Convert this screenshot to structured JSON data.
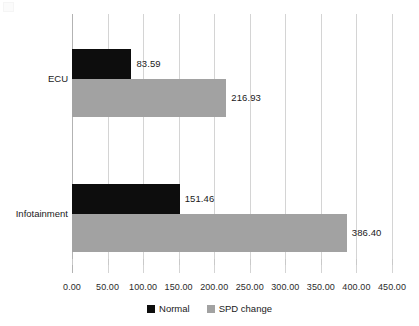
{
  "chart_data": {
    "type": "bar",
    "orientation": "horizontal",
    "title": "",
    "subtitle": "",
    "xlabel": "",
    "ylabel": "",
    "categories": [
      "ECU",
      "Infotainment"
    ],
    "series": [
      {
        "name": "Normal",
        "color": "#0d0d0d",
        "values": [
          83.59,
          151.46
        ],
        "value_labels": [
          "83.59",
          "151.46"
        ]
      },
      {
        "name": "SPD change",
        "color": "#a2a2a2",
        "values": [
          216.93,
          386.4
        ],
        "value_labels": [
          "216.93",
          "386.40"
        ]
      }
    ],
    "xlim": [
      0,
      450
    ],
    "xticks": [
      0,
      50,
      100,
      150,
      200,
      250,
      300,
      350,
      400,
      450
    ],
    "xtick_labels": [
      "0.00",
      "50.00",
      "100.00",
      "150.00",
      "200.00",
      "250.00",
      "300.00",
      "350.00",
      "400.00",
      "450.00"
    ],
    "grid": true,
    "grid_axis": "x",
    "legend": {
      "position": "bottom",
      "entries": [
        {
          "label": "Normal",
          "color": "#0d0d0d"
        },
        {
          "label": "SPD change",
          "color": "#a2a2a2"
        }
      ]
    },
    "colors": {
      "background": "#ffffff",
      "grid": "#d4d4d4",
      "axis": "#b3b3b3",
      "text": "#1a1a1a",
      "normal": "#0d0d0d",
      "spd_change": "#a2a2a2"
    }
  }
}
